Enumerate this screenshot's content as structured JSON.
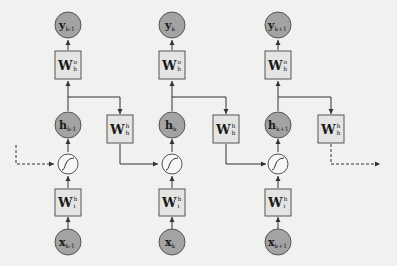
{
  "diagram": {
    "type": "unrolled-rnn",
    "colors": {
      "background": "#f1f1ef",
      "state_node": "#a3a3a3",
      "weight_box": "#e4e4e2",
      "activation": "#f7f7f5",
      "edge": "#333333"
    },
    "columns": [
      {
        "output": {
          "base": "y",
          "sub": "k-1"
        },
        "output_weight": {
          "base": "W",
          "sup": "o",
          "sub": "h"
        },
        "hidden": {
          "base": "h",
          "sub": "k-1"
        },
        "activation": "sigmoid",
        "input_weight": {
          "base": "W",
          "sup": "h",
          "sub": "i"
        },
        "input": {
          "base": "x",
          "sub": "k-1"
        },
        "recurrent_weight": {
          "base": "W",
          "sup": "h",
          "sub": "h"
        }
      },
      {
        "output": {
          "base": "y",
          "sub": "k"
        },
        "output_weight": {
          "base": "W",
          "sup": "o",
          "sub": "h"
        },
        "hidden": {
          "base": "h",
          "sub": "k"
        },
        "activation": "sigmoid",
        "input_weight": {
          "base": "W",
          "sup": "h",
          "sub": "i"
        },
        "input": {
          "base": "x",
          "sub": "k"
        },
        "recurrent_weight": {
          "base": "W",
          "sup": "h",
          "sub": "h"
        }
      },
      {
        "output": {
          "base": "y",
          "sub": "k+1"
        },
        "output_weight": {
          "base": "W",
          "sup": "o",
          "sub": "h"
        },
        "hidden": {
          "base": "h",
          "sub": "k+1"
        },
        "activation": "sigmoid",
        "input_weight": {
          "base": "W",
          "sup": "h",
          "sub": "i"
        },
        "input": {
          "base": "x",
          "sub": "k+1"
        },
        "recurrent_weight": {
          "base": "W",
          "sup": "h",
          "sub": "h"
        }
      }
    ],
    "incoming_edge": "dashed",
    "outgoing_edge": "dashed"
  }
}
